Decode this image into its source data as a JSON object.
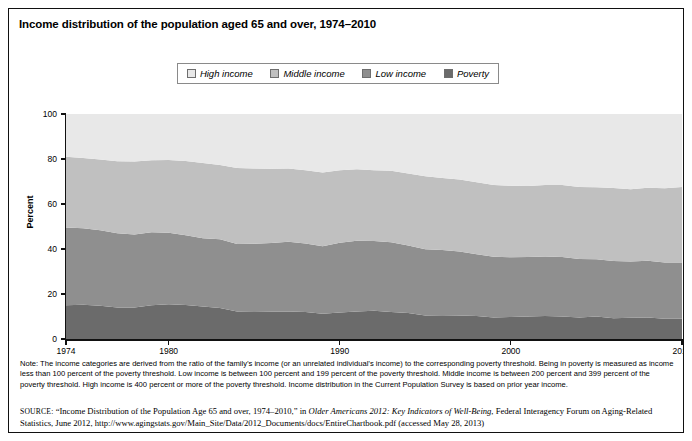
{
  "figure": {
    "title": "Income distribution of the population aged 65 and over, 1974–2010"
  },
  "legend": {
    "items": [
      {
        "label": "High income",
        "color": "#e8e8e8"
      },
      {
        "label": "Middle income",
        "color": "#c0c0c0"
      },
      {
        "label": "Low income",
        "color": "#8f8f8f"
      },
      {
        "label": "Poverty",
        "color": "#6b6b6b"
      }
    ]
  },
  "axes": {
    "ylabel": "Percent",
    "yticks": [
      "0",
      "20",
      "40",
      "60",
      "80",
      "100"
    ],
    "xticks": [
      "1974",
      "1980",
      "1990",
      "2000",
      "2010"
    ]
  },
  "note": {
    "text": "Note: The income categories are derived from the ratio of the family’s income (or an unrelated individual’s income) to the corresponding poverty threshold. Being in poverty is measured as income less than 100 percent of the poverty threshold. Low income is between 100 percent and 199 percent of the poverty threshold. Middle income is between 200 percent and 399 percent of the poverty threshold. High income is 400 percent or more of the poverty threshold. Income distribution in the Current Population Survey is based on prior year income."
  },
  "source": {
    "prefix": "SOURCE:",
    "part1": " “Income Distribution of the Population Age 65 and over, 1974–2010,” in ",
    "italic1": "Older Americans 2012: Key Indicators of Well-Being",
    "part2": ", Federal Interagency Forum on Aging-Related Statistics, June 2012, http://www.agingstats.gov/Main_Site/Data/2012_Documents/docs/EntireChartbook.pdf (accessed May 28, 2013)"
  },
  "chart_data": {
    "type": "area",
    "stacked": true,
    "title": "Income distribution of the population aged 65 and over, 1974–2010",
    "xlabel": "",
    "ylabel": "Percent",
    "ylim": [
      0,
      100
    ],
    "xlim": [
      1974,
      2010
    ],
    "grid": false,
    "legend_position": "top-center",
    "x": [
      1974,
      1975,
      1976,
      1977,
      1978,
      1979,
      1980,
      1981,
      1982,
      1983,
      1984,
      1985,
      1986,
      1987,
      1988,
      1989,
      1990,
      1991,
      1992,
      1993,
      1994,
      1995,
      1996,
      1997,
      1998,
      1999,
      2000,
      2001,
      2002,
      2003,
      2004,
      2005,
      2006,
      2007,
      2008,
      2009,
      2010
    ],
    "series": [
      {
        "name": "Poverty",
        "color": "#6b6b6b",
        "values": [
          15.0,
          15.2,
          14.8,
          14.0,
          14.0,
          15.0,
          15.4,
          15.1,
          14.4,
          13.8,
          12.2,
          12.3,
          12.2,
          12.2,
          12.0,
          11.2,
          11.8,
          12.2,
          12.6,
          12.0,
          11.6,
          10.4,
          10.6,
          10.4,
          10.2,
          9.6,
          9.8,
          10.0,
          10.2,
          10.0,
          9.6,
          10.0,
          9.2,
          9.4,
          9.6,
          9.0,
          9.0
        ]
      },
      {
        "name": "Low income",
        "color": "#8f8f8f",
        "values": [
          34.6,
          34.0,
          33.5,
          33.0,
          32.5,
          32.4,
          31.8,
          31.0,
          30.4,
          30.5,
          30.0,
          30.0,
          30.5,
          31.0,
          30.5,
          30.0,
          31.0,
          31.5,
          31.0,
          31.0,
          30.0,
          29.5,
          29.0,
          28.5,
          27.5,
          27.0,
          26.5,
          26.5,
          26.5,
          26.5,
          26.0,
          25.5,
          25.5,
          25.0,
          25.2,
          25.0,
          25.0
        ]
      },
      {
        "name": "Middle income",
        "color": "#c0c0c0",
        "values": [
          31.4,
          31.2,
          31.5,
          32.0,
          32.4,
          32.0,
          32.4,
          33.0,
          33.4,
          33.0,
          33.8,
          33.5,
          33.0,
          32.6,
          32.5,
          32.8,
          32.2,
          31.8,
          31.4,
          31.8,
          32.0,
          32.4,
          32.0,
          32.0,
          32.0,
          31.8,
          31.8,
          31.5,
          31.8,
          32.0,
          32.0,
          32.0,
          32.4,
          32.2,
          32.4,
          33.0,
          33.6
        ]
      },
      {
        "name": "High income",
        "color": "#e8e8e8",
        "values": [
          19.0,
          19.6,
          20.2,
          21.0,
          21.1,
          20.6,
          20.4,
          20.9,
          21.8,
          22.7,
          24.0,
          24.2,
          24.3,
          24.2,
          25.0,
          26.0,
          25.0,
          24.5,
          25.0,
          25.2,
          26.4,
          27.7,
          28.4,
          29.1,
          30.3,
          31.6,
          31.9,
          32.0,
          31.5,
          31.5,
          32.4,
          32.5,
          32.9,
          33.4,
          32.8,
          33.0,
          32.4
        ]
      }
    ]
  }
}
